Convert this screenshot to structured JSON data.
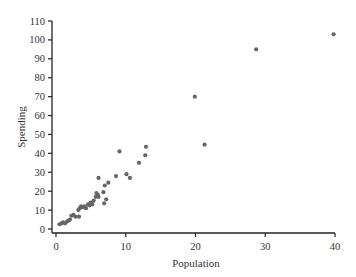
{
  "chart_data": {
    "type": "scatter",
    "title": "",
    "xlabel": "Population",
    "ylabel": "Spending",
    "xlim": [
      0,
      40
    ],
    "ylim": [
      0,
      110
    ],
    "xticks": [
      0,
      10,
      20,
      30,
      40
    ],
    "yticks": [
      0,
      10,
      20,
      30,
      40,
      50,
      60,
      70,
      80,
      90,
      100,
      110
    ],
    "grid": false,
    "legend": null,
    "marker_color": "#666666",
    "points": [
      [
        0.5,
        2.5
      ],
      [
        0.8,
        3
      ],
      [
        1.0,
        3.5
      ],
      [
        1.3,
        3
      ],
      [
        1.6,
        4
      ],
      [
        1.8,
        4.5
      ],
      [
        2.0,
        5
      ],
      [
        2.2,
        7
      ],
      [
        2.5,
        7.5
      ],
      [
        2.8,
        6.5
      ],
      [
        3.2,
        10
      ],
      [
        3.3,
        6.5
      ],
      [
        3.4,
        11
      ],
      [
        3.6,
        12
      ],
      [
        3.8,
        11.5
      ],
      [
        4.1,
        12
      ],
      [
        4.3,
        11
      ],
      [
        4.6,
        13
      ],
      [
        4.8,
        12.5
      ],
      [
        5.0,
        14
      ],
      [
        5.2,
        13
      ],
      [
        5.4,
        15
      ],
      [
        5.7,
        17
      ],
      [
        5.8,
        19
      ],
      [
        6.0,
        18
      ],
      [
        6.1,
        17
      ],
      [
        6.1,
        27
      ],
      [
        6.8,
        19.5
      ],
      [
        6.9,
        13.6
      ],
      [
        7.0,
        23
      ],
      [
        7.2,
        15.7
      ],
      [
        7.5,
        24.5
      ],
      [
        8.6,
        28
      ],
      [
        9.1,
        41
      ],
      [
        10.1,
        29
      ],
      [
        10.6,
        27
      ],
      [
        11.9,
        35
      ],
      [
        12.8,
        39
      ],
      [
        12.9,
        43.5
      ],
      [
        19.9,
        70
      ],
      [
        21.3,
        44.6
      ],
      [
        28.7,
        95
      ],
      [
        39.8,
        103
      ]
    ]
  }
}
